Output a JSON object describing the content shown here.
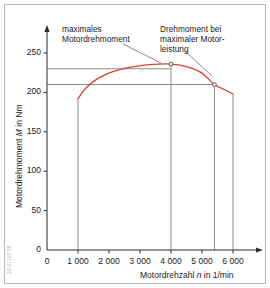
{
  "figure": {
    "side_code": "2S-01108-38"
  },
  "annotations": [
    {
      "id": "annot-max-torque",
      "lines": [
        "maximales",
        "Motordrehmoment"
      ],
      "x": 62,
      "y": 24,
      "leader": {
        "x1": 123,
        "y1": 44,
        "x2": 161,
        "y2": 63
      }
    },
    {
      "id": "annot-torque-at-max-power",
      "lines": [
        "Drehmoment bei",
        "maximaler Motor-",
        "leistung"
      ],
      "x": 160,
      "y": 24,
      "leader": {
        "x1": 186,
        "y1": 52,
        "x2": 212,
        "y2": 76
      }
    }
  ],
  "chart_data": {
    "type": "line",
    "title": "",
    "xlabel": "Motordrehzahl n in 1/min",
    "ylabel": "Motordrehmoment M in Nm",
    "xlabel_parts": {
      "pre": "Motordrehzahl ",
      "sym": "n",
      "post": " in 1/min"
    },
    "ylabel_parts": {
      "pre": "Motordrehmoment ",
      "sym": "M",
      "post": " in Nm"
    },
    "xlim": [
      0,
      6500
    ],
    "ylim": [
      0,
      270
    ],
    "xticks": [
      0,
      1000,
      2000,
      3000,
      4000,
      5000,
      6000
    ],
    "xticklabels": [
      "0",
      "1 000",
      "2 000",
      "3 000",
      "4 000",
      "5 000",
      "6 000"
    ],
    "yticks": [
      0,
      50,
      100,
      150,
      200,
      250
    ],
    "yticklabels": [
      "0",
      "50",
      "100",
      "150",
      "200",
      "250"
    ],
    "grid": false,
    "legend": "none",
    "series": [
      {
        "name": "Volllast-Drehmomentkurve",
        "color": "#d4452e",
        "x": [
          1000,
          1200,
          1500,
          1800,
          2100,
          2400,
          2700,
          3000,
          3300,
          3600,
          4000,
          4300,
          4600,
          5000,
          5400,
          5700,
          6000
        ],
        "y": [
          192,
          203,
          214,
          221,
          226,
          229.5,
          232,
          234,
          235.3,
          236,
          236,
          234.5,
          231.5,
          224.5,
          210,
          204,
          198
        ]
      }
    ],
    "vertical_droplines": [
      {
        "x": 1000,
        "y_from": 0,
        "y_to": 192
      },
      {
        "x": 4000,
        "y_from": 0,
        "y_to": 236
      },
      {
        "x": 5400,
        "y_from": 0,
        "y_to": 210
      },
      {
        "x": 6000,
        "y_from": 0,
        "y_to": 198
      }
    ],
    "horizontal_reflines": [
      {
        "y": 230,
        "x_from": 0,
        "x_to": 4000
      },
      {
        "y": 210,
        "x_from": 0,
        "x_to": 5400
      }
    ],
    "markers": [
      {
        "label": "maximales Motordrehmoment",
        "x": 4000,
        "y": 236
      },
      {
        "label": "Drehmoment bei maximaler Motorleistung",
        "x": 5400,
        "y": 210
      }
    ]
  }
}
